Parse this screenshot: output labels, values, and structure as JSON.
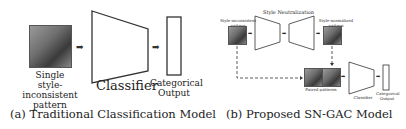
{
  "panel_a": {
    "input_label": [
      "Single",
      "style-inconsistent",
      "pattern"
    ],
    "classifier_label": "Classifier",
    "output_label": [
      "Categorical",
      "Output"
    ],
    "caption": "(a) Traditional Classification Model"
  },
  "panel_b": {
    "input_label": "Style-inconsistent pattern",
    "normalization_label": "Style Neutralization",
    "normalized_label": "Style-normalized pattern",
    "paired_label": "Paired patterns",
    "classifier_label": "Classifier",
    "output_label": [
      "Categorical",
      "Output"
    ],
    "caption": "(b) Proposed SN-GAC Model"
  },
  "icons": {
    "arrow": "➡"
  }
}
